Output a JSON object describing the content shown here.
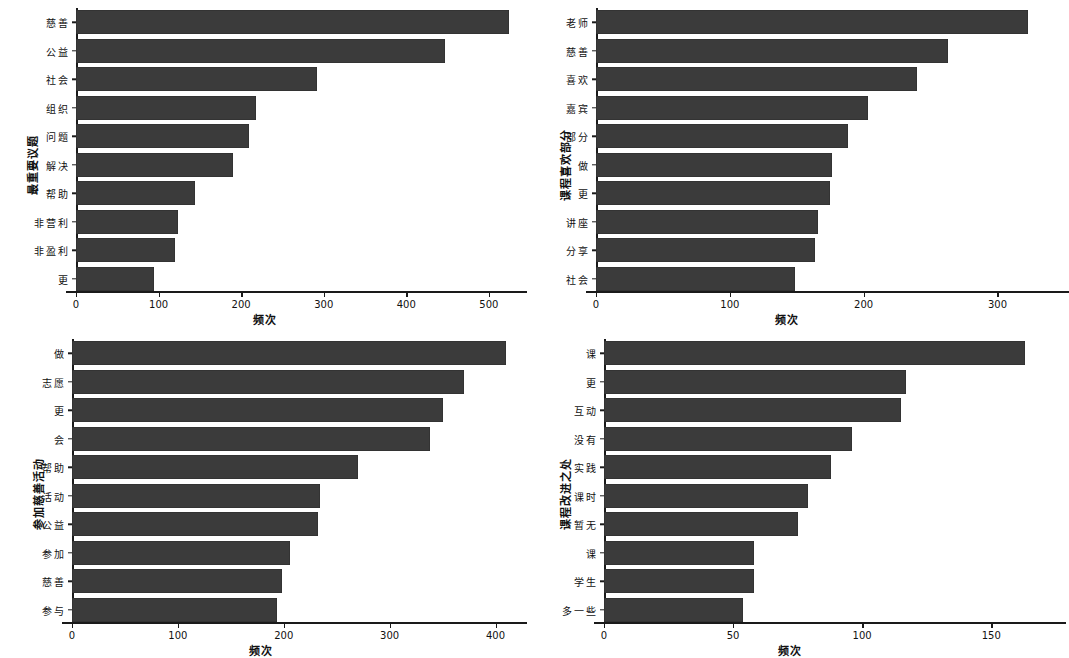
{
  "figure": {
    "background": "#ffffff",
    "bar_color": "#3b3b3b",
    "axis_color": "#1a1a1a",
    "panel_count": 4,
    "layout": "2x2"
  },
  "chart_data": [
    {
      "id": "panel-top-left",
      "type": "bar",
      "orientation": "horizontal",
      "title": "",
      "xlabel": "频次",
      "ylabel": "最重要议题",
      "categories": [
        "慈善",
        "公益",
        "社会",
        "组织",
        "问题",
        "解决",
        "帮助",
        "非营利",
        "非盈利",
        "更"
      ],
      "values": [
        525,
        447,
        292,
        218,
        209,
        190,
        144,
        124,
        120,
        94
      ],
      "xlim": [
        0,
        545
      ],
      "xticks": [
        0,
        100,
        200,
        300,
        400,
        500
      ],
      "xticklabels": [
        "0",
        "100",
        "200",
        "300",
        "400",
        "500"
      ],
      "grid": false,
      "legend": "none"
    },
    {
      "id": "panel-top-right",
      "type": "bar",
      "orientation": "horizontal",
      "title": "",
      "xlabel": "频次",
      "ylabel": "课程喜欢部分",
      "categories": [
        "老师",
        "慈善",
        "喜欢",
        "嘉宾",
        "部分",
        "做",
        "更",
        "讲座",
        "分享",
        "社会"
      ],
      "values": [
        323,
        263,
        240,
        203,
        188,
        176,
        175,
        166,
        164,
        149
      ],
      "xlim": [
        0,
        340
      ],
      "xticks": [
        0,
        100,
        200,
        300
      ],
      "xticklabels": [
        "0",
        "100",
        "200",
        "300"
      ],
      "grid": false,
      "legend": "none"
    },
    {
      "id": "panel-bottom-left",
      "type": "bar",
      "orientation": "horizontal",
      "title": "",
      "xlabel": "频次",
      "ylabel": "参加慈善活动",
      "categories": [
        "做",
        "志愿",
        "更",
        "会",
        "帮助",
        "活动",
        "公益",
        "参加",
        "慈善",
        "参与"
      ],
      "values": [
        410,
        370,
        350,
        338,
        270,
        234,
        232,
        206,
        198,
        194
      ],
      "xlim": [
        0,
        425
      ],
      "xticks": [
        0,
        100,
        200,
        300,
        400
      ],
      "xticklabels": [
        "0",
        "100",
        "200",
        "300",
        "400"
      ],
      "grid": false,
      "legend": "none"
    },
    {
      "id": "panel-bottom-right",
      "type": "bar",
      "orientation": "horizontal",
      "title": "",
      "xlabel": "频次",
      "ylabel": "课程改进之处",
      "categories": [
        "课",
        "更",
        "互动",
        "没有",
        "实践",
        "课时",
        "暂无",
        "课",
        "学生",
        "多一些"
      ],
      "values": [
        163,
        117,
        115,
        96,
        88,
        79,
        75,
        58,
        58,
        54
      ],
      "xlim": [
        0,
        172
      ],
      "xticks": [
        0,
        50,
        100,
        150
      ],
      "xticklabels": [
        "0",
        "50",
        "100",
        "150"
      ],
      "grid": false,
      "legend": "none"
    }
  ]
}
